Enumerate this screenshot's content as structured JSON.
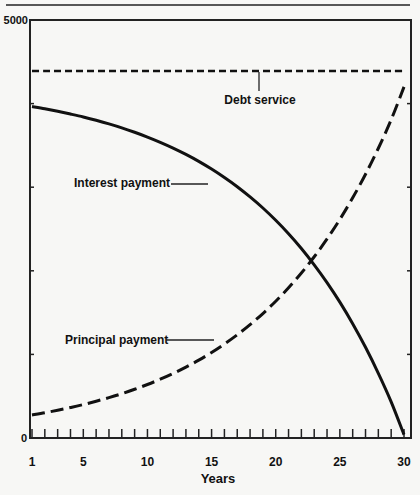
{
  "chart_data": {
    "type": "line",
    "title": "",
    "xlabel": "Years",
    "ylabel": "",
    "xlim": [
      1,
      30
    ],
    "ylim": [
      0,
      5000
    ],
    "grid": false,
    "legend": "inline annotations",
    "x_tick_labels": [
      "1",
      "5",
      "10",
      "15",
      "20",
      "25",
      "30"
    ],
    "x_tick_values": [
      1,
      5,
      10,
      15,
      20,
      25,
      30
    ],
    "y_tick_labels": [
      "0",
      "5000"
    ],
    "y_tick_values": [
      0,
      5000
    ],
    "y_minor_ticks": [
      1000,
      2000,
      3000,
      4000
    ],
    "x": [
      1,
      2,
      3,
      4,
      5,
      6,
      7,
      8,
      9,
      10,
      11,
      12,
      13,
      14,
      15,
      16,
      17,
      18,
      19,
      20,
      21,
      22,
      23,
      24,
      25,
      26,
      27,
      28,
      29,
      30
    ],
    "series": [
      {
        "name": "Debt service",
        "style": "short-dashed",
        "values": [
          4390,
          4390,
          4390,
          4390,
          4390,
          4390,
          4390,
          4390,
          4390,
          4390,
          4390,
          4390,
          4390,
          4390,
          4390,
          4390,
          4390,
          4390,
          4390,
          4390,
          4390,
          4390,
          4390,
          4390,
          4390,
          4390,
          4390,
          4390,
          4390,
          4390
        ]
      },
      {
        "name": "Interest payment",
        "style": "solid",
        "values": [
          3965,
          3938,
          3908,
          3875,
          3840,
          3800,
          3757,
          3710,
          3657,
          3600,
          3537,
          3468,
          3392,
          3309,
          3217,
          3116,
          3006,
          2884,
          2751,
          2604,
          2443,
          2267,
          2072,
          1859,
          1625,
          1367,
          1085,
          774,
          433,
          40
        ]
      },
      {
        "name": "Principal payment",
        "style": "long-dashed",
        "values": [
          275,
          302,
          332,
          365,
          400,
          440,
          483,
          530,
          583,
          640,
          703,
          772,
          848,
          931,
          1023,
          1124,
          1234,
          1356,
          1489,
          1636,
          1797,
          1973,
          2168,
          2381,
          2615,
          2873,
          3155,
          3466,
          3807,
          4200
        ]
      }
    ],
    "annotations": [
      {
        "text": "Debt service",
        "target": "Debt service",
        "near_x": 19.8
      },
      {
        "text": "Interest payment",
        "target": "Interest payment",
        "near_x": 14.3
      },
      {
        "text": "Principal payment",
        "target": "Principal payment",
        "near_x": 15.3
      }
    ]
  },
  "labels": {
    "y_top": "5000",
    "y_zero": "0",
    "x_axis_title": "Years",
    "debt_service": "Debt service",
    "interest_payment": "Interest payment",
    "principal_payment": "Principal payment"
  }
}
